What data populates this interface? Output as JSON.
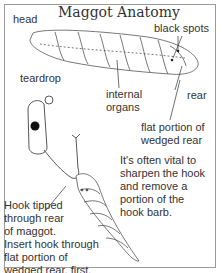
{
  "title": "Maggot Anatomy",
  "labels": {
    "head": "head",
    "black_spots": "black spots",
    "teardrop": "teardrop",
    "internal_organs_1": "internal",
    "internal_organs_2": "organs",
    "rear": "rear",
    "flat_portion_1": "flat portion of",
    "flat_portion_2": "wedged rear"
  },
  "notes": {
    "sharpen": [
      "It's often vital to",
      "sharpen the hook",
      "and remove a",
      "portion of the",
      "hook barb."
    ],
    "hook": [
      "Hook tipped",
      "through rear",
      "of maggot.",
      "Insert hook through",
      "flat portion of",
      "wedged rear, first."
    ]
  }
}
